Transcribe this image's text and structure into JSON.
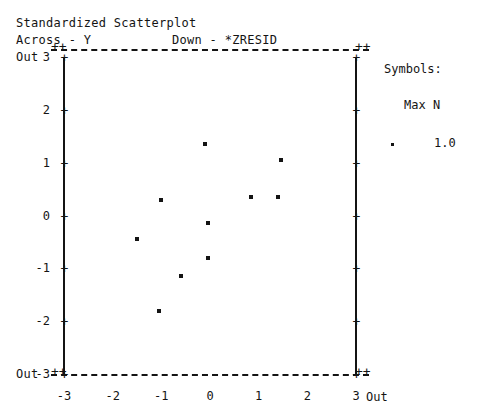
{
  "header": {
    "title": "Standardized Scatterplot",
    "across_label": "Across - Y",
    "down_label": "Down - *ZRESID"
  },
  "axes": {
    "out_top": "Out",
    "out_bottom": "Out",
    "x_out_right": "Out",
    "y_ticks": [
      "3",
      "2",
      "1",
      "0",
      "-1",
      "-2",
      "-3"
    ],
    "x_ticks": [
      "-3",
      "-2",
      "-1",
      "0",
      "1",
      "2",
      "3"
    ]
  },
  "legend": {
    "symbols_label": "Symbols:",
    "maxn_label": "Max N",
    "maxn_value": "1.0"
  },
  "colors": {
    "ink": "#141414",
    "background": "#ffffff"
  },
  "chart_data": {
    "type": "scatter",
    "title": "Standardized Scatterplot",
    "xlabel": "Across - Y",
    "ylabel": "Down - *ZRESID",
    "xlim": [
      -3,
      3
    ],
    "ylim": [
      -3,
      3
    ],
    "grid": false,
    "legend_position": "right",
    "out_of_range_markers": [
      "Out"
    ],
    "max_n": 1.0,
    "n_points": 12,
    "points": [
      {
        "x": -0.1,
        "y": 1.35
      },
      {
        "x": 1.45,
        "y": 1.05
      },
      {
        "x": -1.0,
        "y": 0.3
      },
      {
        "x": 0.85,
        "y": 0.35
      },
      {
        "x": 1.4,
        "y": 0.35
      },
      {
        "x": -0.05,
        "y": -0.15
      },
      {
        "x": -1.5,
        "y": -0.45
      },
      {
        "x": -0.05,
        "y": -0.8
      },
      {
        "x": -0.6,
        "y": -1.15
      },
      {
        "x": -1.05,
        "y": -1.8
      }
    ],
    "series": [
      {
        "name": "residuals",
        "x": [
          -0.1,
          1.45,
          -1.0,
          0.85,
          1.4,
          -0.05,
          -1.5,
          -0.05,
          -0.6,
          -1.05
        ],
        "y": [
          1.35,
          1.05,
          0.3,
          0.35,
          0.35,
          -0.15,
          -0.45,
          -0.8,
          -1.15,
          -1.8
        ]
      }
    ]
  }
}
